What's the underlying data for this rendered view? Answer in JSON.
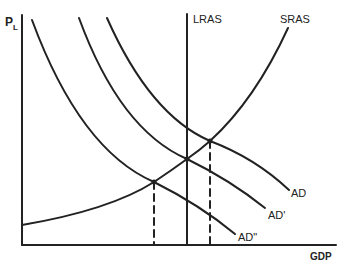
{
  "diagram": {
    "y_axis_label": "P",
    "y_axis_subscript": "L",
    "x_axis_label": "GDP",
    "curves": [
      {
        "name": "LRAS",
        "label": "LRAS",
        "type": "vertical"
      },
      {
        "name": "SRAS",
        "label": "SRAS",
        "type": "upward"
      },
      {
        "name": "AD",
        "label": "AD",
        "type": "downward"
      },
      {
        "name": "AD'",
        "label": "AD'",
        "type": "downward"
      },
      {
        "name": "AD''",
        "label": "AD\"",
        "type": "downward"
      }
    ],
    "equilibria": [
      {
        "curves": [
          "AD''",
          "SRAS"
        ],
        "note": "below potential output"
      },
      {
        "curves": [
          "AD'",
          "SRAS",
          "LRAS"
        ],
        "note": "long-run equilibrium"
      },
      {
        "curves": [
          "AD",
          "SRAS"
        ],
        "note": "above potential output"
      }
    ],
    "colors": {
      "line": "#222222",
      "background": "#ffffff"
    }
  }
}
